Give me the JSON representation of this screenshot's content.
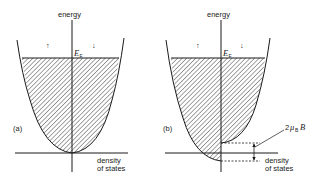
{
  "figure": {
    "panels": [
      {
        "id": "a",
        "panel_label": "(a)",
        "y_axis_label": "energy",
        "x_axis_label_line1": "density",
        "x_axis_label_line2": "of states",
        "fermi_label": "E",
        "fermi_subscript": "F",
        "spin_up_symbol": "↑",
        "spin_down_symbol": "↓",
        "description": "Unpolarized: spin-up and spin-down density-of-states parabolas share the same band bottom; both filled (hatched) up to Fermi energy."
      },
      {
        "id": "b",
        "panel_label": "(b)",
        "y_axis_label": "energy",
        "x_axis_label_line1": "density",
        "x_axis_label_line2": "of states",
        "fermi_label": "E",
        "fermi_subscript": "F",
        "spin_up_symbol": "↑",
        "spin_down_symbol": "↓",
        "splitting_label_prefix": "2",
        "splitting_label_mu": "μ",
        "splitting_label_sub": "B",
        "splitting_label_field": "B",
        "description": "In magnetic field B, spin-up band lowered and spin-down band raised; bands shifted relative to each other by 2μ_B B."
      }
    ],
    "colors": {
      "line": "#1a1a1a",
      "hatch": "#333333",
      "background": "#ffffff"
    }
  }
}
